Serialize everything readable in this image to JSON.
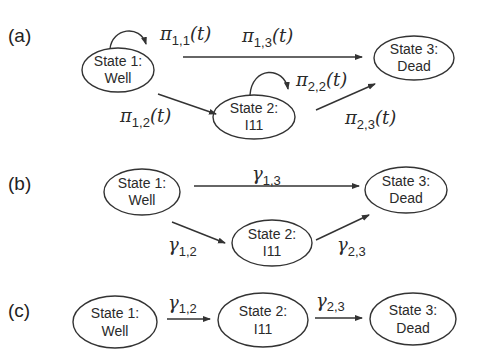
{
  "panels": {
    "a": {
      "label": "(a)",
      "states": {
        "s1": {
          "line1": "State 1:",
          "line2": "Well"
        },
        "s2": {
          "line1": "State 2:",
          "line2": "I11"
        },
        "s3": {
          "line1": "State 3:",
          "line2": "Dead"
        }
      },
      "transitions": {
        "t11": {
          "sym": "π",
          "sub": "1,1",
          "arg": "(t)"
        },
        "t13": {
          "sym": "π",
          "sub": "1,3",
          "arg": "(t)"
        },
        "t22": {
          "sym": "π",
          "sub": "2,2",
          "arg": "(t)"
        },
        "t12": {
          "sym": "π",
          "sub": "1,2",
          "arg": "(t)"
        },
        "t23": {
          "sym": "π",
          "sub": "2,3",
          "arg": "(t)"
        }
      }
    },
    "b": {
      "label": "(b)",
      "states": {
        "s1": {
          "line1": "State 1:",
          "line2": "Well"
        },
        "s2": {
          "line1": "State 2:",
          "line2": "I11"
        },
        "s3": {
          "line1": "State 3:",
          "line2": "Dead"
        }
      },
      "transitions": {
        "t13": {
          "sym": "γ",
          "sub": "1,3"
        },
        "t12": {
          "sym": "γ",
          "sub": "1,2"
        },
        "t23": {
          "sym": "γ",
          "sub": "2,3"
        }
      }
    },
    "c": {
      "label": "(c)",
      "states": {
        "s1": {
          "line1": "State 1:",
          "line2": "Well"
        },
        "s2": {
          "line1": "State 2:",
          "line2": "I11"
        },
        "s3": {
          "line1": "State 3:",
          "line2": "Dead"
        }
      },
      "transitions": {
        "t12": {
          "sym": "γ",
          "sub": "1,2"
        },
        "t23": {
          "sym": "γ",
          "sub": "2,3"
        }
      }
    }
  }
}
